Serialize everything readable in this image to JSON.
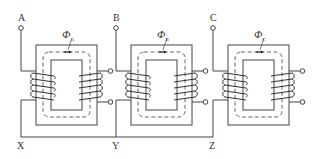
{
  "diagram": {
    "type": "three-phase transformer winding connection",
    "phases": [
      {
        "terminal_top": "A",
        "terminal_bottom": "X",
        "flux_symbol": "Φ",
        "flux_sub": "A",
        "x": 36
      },
      {
        "terminal_top": "B",
        "terminal_bottom": "Y",
        "flux_symbol": "Φ",
        "flux_sub": "B",
        "x": 131
      },
      {
        "terminal_top": "C",
        "terminal_bottom": "Z",
        "flux_symbol": "Φ",
        "flux_sub": "C",
        "x": 228
      }
    ],
    "colors": {
      "line": "#444444",
      "background": "#ffffff"
    }
  }
}
